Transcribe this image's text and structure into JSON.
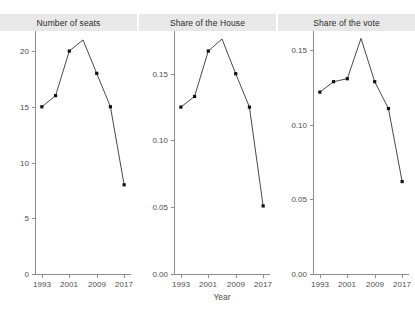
{
  "chart_data": {
    "type": "line",
    "title": "",
    "xlabel": "Year",
    "ylabel": "",
    "grid": false,
    "legend": "none",
    "x": [
      1993,
      1997,
      2001,
      2005,
      2009,
      2013,
      2017
    ],
    "x_tick_labels": [
      "1993",
      "2001",
      "2009",
      "2017"
    ],
    "x_tick_values": [
      1993,
      2001,
      2009,
      2017
    ],
    "xlim": [
      1991,
      2019
    ],
    "panels": [
      {
        "title": "Number of seats",
        "values": [
          15,
          16,
          20,
          21,
          18,
          15,
          8
        ],
        "ylim": [
          0,
          21.8
        ],
        "y_tick_labels": [
          "0",
          "5",
          "10",
          "15",
          "20"
        ],
        "y_tick_values": [
          0,
          5,
          10,
          15,
          20
        ]
      },
      {
        "title": "Share of the House",
        "values": [
          0.125,
          0.133,
          0.167,
          0.176,
          0.15,
          0.125,
          0.051
        ],
        "ylim": [
          0,
          0.182
        ],
        "y_tick_labels": [
          "0.00",
          "0.05",
          "0.10",
          "0.15"
        ],
        "y_tick_values": [
          0,
          0.05,
          0.1,
          0.15
        ]
      },
      {
        "title": "Share of the vote",
        "values": [
          0.122,
          0.129,
          0.131,
          0.158,
          0.129,
          0.111,
          0.062
        ],
        "ylim": [
          0,
          0.163
        ],
        "y_tick_labels": [
          "0.00",
          "0.05",
          "0.10",
          "0.15"
        ],
        "y_tick_values": [
          0,
          0.05,
          0.1,
          0.15
        ]
      }
    ],
    "colors": {
      "line": "#333333",
      "point": "#111111",
      "axis": "#8c8c8c",
      "strip_background": "#e8e8e8",
      "background": "#ffffff",
      "text": "#4d4d4d"
    }
  }
}
